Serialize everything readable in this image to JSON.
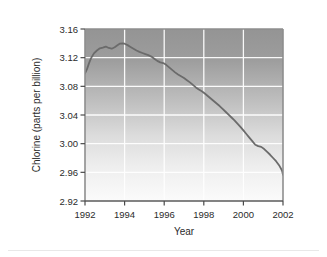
{
  "chart_data": {
    "type": "line",
    "title": "",
    "xlabel": "Year",
    "ylabel": "Chlorine (parts per billion)",
    "xlim": [
      1992,
      2002
    ],
    "ylim": [
      2.92,
      3.16
    ],
    "xticks": [
      "1992",
      "1994",
      "1996",
      "1998",
      "2000",
      "2002"
    ],
    "xtick_values": [
      1992,
      1994,
      1996,
      1998,
      2000,
      2002
    ],
    "yticks": [
      "2.92",
      "2.96",
      "3.00",
      "3.04",
      "3.08",
      "3.12",
      "3.16"
    ],
    "ytick_values": [
      2.92,
      2.96,
      3.0,
      3.04,
      3.08,
      3.12,
      3.16
    ],
    "grid": true,
    "legend": null,
    "series": [
      {
        "name": "Chlorine",
        "color": "#6b6b6b",
        "x": [
          1992.0,
          1992.1,
          1992.2,
          1992.3,
          1992.45,
          1992.6,
          1992.75,
          1992.9,
          1993.05,
          1993.2,
          1993.35,
          1993.5,
          1993.62,
          1993.75,
          1993.9,
          1994.0,
          1994.15,
          1994.3,
          1994.45,
          1994.6,
          1994.75,
          1994.9,
          1995.05,
          1995.2,
          1995.35,
          1995.5,
          1995.65,
          1995.8,
          1995.95,
          1996.1,
          1996.25,
          1996.4,
          1996.55,
          1996.7,
          1996.85,
          1997.0,
          1997.15,
          1997.3,
          1997.45,
          1997.6,
          1997.75,
          1997.9,
          1998.05,
          1998.2,
          1998.35,
          1998.5,
          1998.65,
          1998.8,
          1998.95,
          1999.1,
          1999.25,
          1999.4,
          1999.55,
          1999.7,
          1999.85,
          2000.0,
          2000.15,
          2000.3,
          2000.45,
          2000.6,
          2000.75,
          2000.9,
          2001.05,
          2001.2,
          2001.35,
          2001.5,
          2001.65,
          2001.8,
          2001.95,
          2002.0
        ],
        "y": [
          3.098,
          3.104,
          3.112,
          3.119,
          3.126,
          3.13,
          3.133,
          3.134,
          3.1355,
          3.1335,
          3.1325,
          3.1345,
          3.137,
          3.1395,
          3.14,
          3.1395,
          3.1375,
          3.135,
          3.1325,
          3.13,
          3.128,
          3.1265,
          3.125,
          3.1235,
          3.1215,
          3.1185,
          3.1155,
          3.1135,
          3.1125,
          3.11,
          3.1065,
          3.103,
          3.0995,
          3.0965,
          3.094,
          3.0915,
          3.0885,
          3.0855,
          3.082,
          3.0785,
          3.0755,
          3.073,
          3.07,
          3.0665,
          3.063,
          3.0595,
          3.056,
          3.0525,
          3.0485,
          3.0445,
          3.0405,
          3.0365,
          3.0325,
          3.028,
          3.0235,
          3.0185,
          3.0135,
          3.0085,
          3.0035,
          2.9985,
          2.9965,
          2.9955,
          2.9925,
          2.9885,
          2.9845,
          2.98,
          2.9755,
          2.97,
          2.9625,
          2.9565
        ]
      }
    ]
  },
  "figure": {
    "plot_bg_top_color": "#989898",
    "plot_bg_bottom_color": "#f7f7f7",
    "gridline_color": "#ffffff",
    "axis_color": "#8a8a8a",
    "line_color": "#6b6b6b",
    "page_bg": "#ffffff"
  }
}
